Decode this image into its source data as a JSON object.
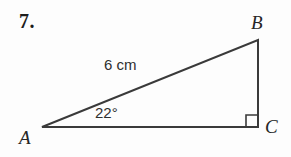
{
  "figure": {
    "problem_number": "7.",
    "type": "right-triangle",
    "background_color": "#fdfdfd",
    "stroke_color": "#3a3a3a",
    "stroke_width": 2,
    "vertices": [
      {
        "name": "A",
        "label": "A",
        "x": 42,
        "y": 127,
        "label_x": 19,
        "label_y": 128
      },
      {
        "name": "B",
        "label": "B",
        "x": 258,
        "y": 40,
        "label_x": 251,
        "label_y": 13
      },
      {
        "name": "C",
        "label": "C",
        "x": 258,
        "y": 127,
        "label_x": 265,
        "label_y": 117
      }
    ],
    "sides": [
      {
        "name": "AB",
        "from": "A",
        "to": "B",
        "label": "6 cm",
        "label_x": 104,
        "label_y": 57
      },
      {
        "name": "AC",
        "from": "A",
        "to": "C",
        "label": ""
      },
      {
        "name": "BC",
        "from": "B",
        "to": "C",
        "label": ""
      }
    ],
    "angles": [
      {
        "at": "A",
        "label": "22°",
        "label_x": 95,
        "label_y": 105
      },
      {
        "at": "C",
        "label": "",
        "marker": "right-angle-square",
        "size": 12
      }
    ],
    "side_length_label": "6 cm",
    "angle_label": "22°"
  }
}
